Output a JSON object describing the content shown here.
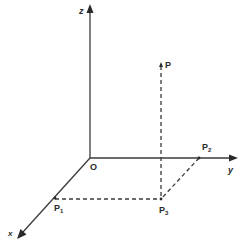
{
  "diagram": {
    "axes": {
      "x": {
        "label": "x"
      },
      "y": {
        "label": "y"
      },
      "z": {
        "label": "z"
      }
    },
    "origin": {
      "label": "O"
    },
    "points": {
      "P": {
        "label": "P",
        "sub": ""
      },
      "P1": {
        "label": "P",
        "sub": "1"
      },
      "P2": {
        "label": "P",
        "sub": "2"
      },
      "P3": {
        "label": "P",
        "sub": "3"
      }
    },
    "colors": {
      "ink": "#2a2a2a",
      "background": "#ffffff"
    }
  }
}
